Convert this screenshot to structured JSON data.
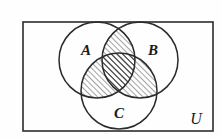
{
  "figure": {
    "kind": "venn-diagram",
    "universe_label": "U",
    "background_color": "#fefefe",
    "stroke_color": "#2b2b2b",
    "hatch_color": "#333333",
    "label_color": "#1a1a1a"
  },
  "universe": {
    "label": "U",
    "rect": {
      "x": 23,
      "y": 22,
      "width": 190,
      "height": 109
    },
    "label_pos": {
      "x": 196,
      "y": 124
    },
    "stroke_width": 1.6
  },
  "sets": [
    {
      "id": "A",
      "label": "A",
      "center": {
        "x": 97,
        "y": 60
      },
      "radius": 38,
      "label_pos": {
        "x": 86,
        "y": 55
      }
    },
    {
      "id": "B",
      "label": "B",
      "center": {
        "x": 140,
        "y": 60
      },
      "radius": 38,
      "label_pos": {
        "x": 153,
        "y": 55
      }
    },
    {
      "id": "C",
      "label": "C",
      "center": {
        "x": 119,
        "y": 91
      },
      "radius": 38,
      "label_pos": {
        "x": 119,
        "y": 118
      }
    }
  ],
  "shaded_regions": [
    {
      "id": "A-and-B",
      "name": "A ∩ B",
      "shaded": true
    },
    {
      "id": "A-and-C",
      "name": "A ∩ C",
      "shaded": true
    },
    {
      "id": "B-and-C",
      "name": "B ∩ C",
      "shaded": true
    },
    {
      "id": "A-and-B-and-C",
      "name": "A ∩ B ∩ C",
      "shaded": true
    }
  ],
  "unshaded_regions": [
    {
      "id": "A-only",
      "name": "A only",
      "shaded": false
    },
    {
      "id": "B-only",
      "name": "B only",
      "shaded": false
    },
    {
      "id": "C-only",
      "name": "C only",
      "shaded": false
    },
    {
      "id": "outside",
      "name": "outside all sets",
      "shaded": false
    }
  ],
  "hatch": {
    "angle_degrees": 45,
    "spacing": 4,
    "line_width": 0.9
  },
  "fonts": {
    "set_label_size": 15,
    "universe_label_size": 16
  }
}
